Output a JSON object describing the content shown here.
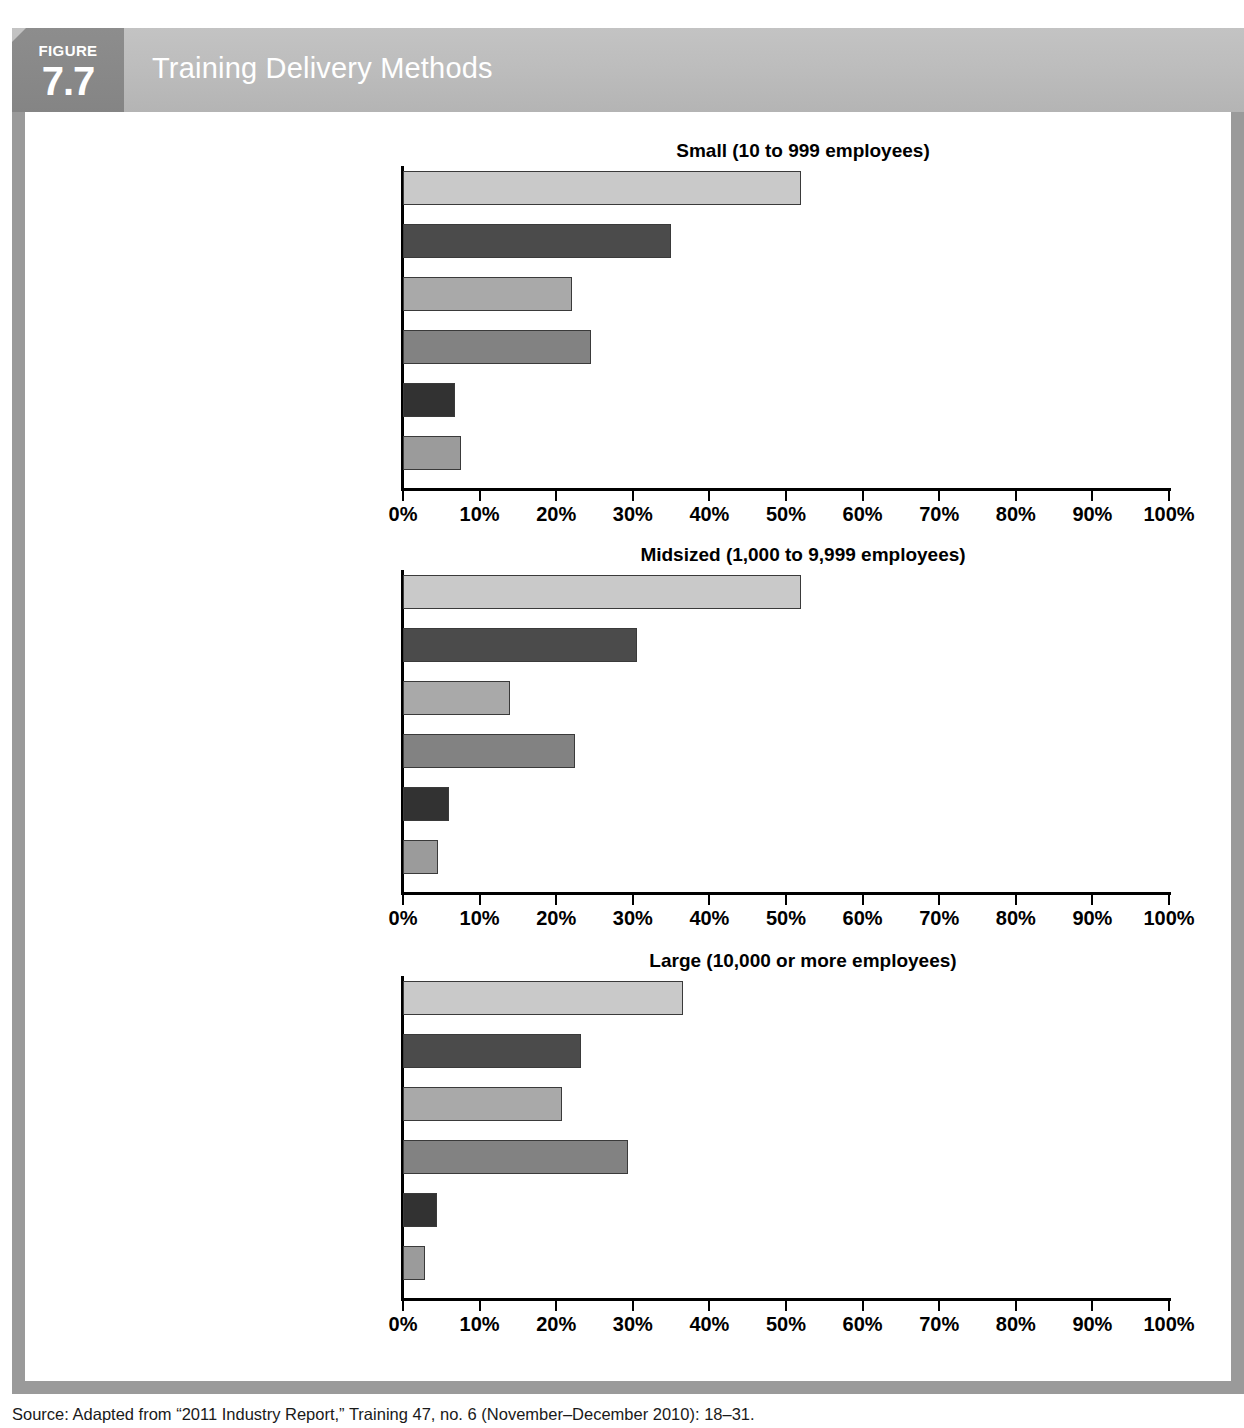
{
  "figure": {
    "badge_word": "FIGURE",
    "badge_number": "7.7",
    "title": "Training Delivery Methods"
  },
  "source_note": "Source: Adapted from “2011 Industry Report,” Training 47, no. 6 (November–December 2010): 18–31.",
  "axis": {
    "tick_labels": [
      "0%",
      "10%",
      "20%",
      "30%",
      "40%",
      "50%",
      "60%",
      "70%",
      "80%",
      "90%",
      "100%"
    ],
    "min": 0,
    "max": 100
  },
  "categories": [
    "Instructor-Led\nClassroom Only",
    "Blended Learning (a combination\nof methods listed below)",
    "Virtual Classroom/Webcast Only\n(instructor from remote location)",
    "Online or Computer-Based\nMethods Only (no instructor)",
    "Social Networking Only (wikis,\nblogs, communities of practice)",
    "Moblie Only (cell phones,\niPods, PDAs)"
  ],
  "bar_colors": [
    "#c9c9c9",
    "#4b4b4b",
    "#a9a9a9",
    "#828282",
    "#323232",
    "#9b9b9b"
  ],
  "chart_data": [
    {
      "type": "bar",
      "orientation": "horizontal",
      "title": "Small (10 to 999 employees)",
      "xlabel": "",
      "ylabel": "",
      "xlim": [
        0,
        100
      ],
      "grid": false,
      "legend": "none",
      "categories": [
        "Instructor-Led Classroom Only",
        "Blended Learning (a combination of methods listed below)",
        "Virtual Classroom/Webcast Only (instructor from remote location)",
        "Online or Computer-Based Methods Only (no instructor)",
        "Social Networking Only (wikis, blogs, communities of practice)",
        "Moblie Only (cell phones, iPods, PDAs)"
      ],
      "values": [
        52,
        35,
        22,
        24.5,
        6.8,
        7.6
      ],
      "tick_labels": [
        "0%",
        "10%",
        "20%",
        "30%",
        "40%",
        "50%",
        "60%",
        "70%",
        "80%",
        "90%",
        "100%"
      ]
    },
    {
      "type": "bar",
      "orientation": "horizontal",
      "title": "Midsized (1,000 to 9,999 employees)",
      "xlabel": "",
      "ylabel": "",
      "xlim": [
        0,
        100
      ],
      "grid": false,
      "legend": "none",
      "categories": [
        "Instructor-Led Classroom Only",
        "Blended Learning (a combination of methods listed below)",
        "Virtual Classroom/Webcast Only (instructor from remote location)",
        "Online or Computer-Based Methods Only (no instructor)",
        "Social Networking Only (wikis, blogs, communities of practice)",
        "Moblie Only (cell phones, iPods, PDAs)"
      ],
      "values": [
        52,
        30.5,
        14,
        22.5,
        6,
        4.6
      ],
      "tick_labels": [
        "0%",
        "10%",
        "20%",
        "30%",
        "40%",
        "50%",
        "60%",
        "70%",
        "80%",
        "90%",
        "100%"
      ]
    },
    {
      "type": "bar",
      "orientation": "horizontal",
      "title": "Large (10,000 or more employees)",
      "xlabel": "",
      "ylabel": "",
      "xlim": [
        0,
        100
      ],
      "grid": false,
      "legend": "none",
      "categories": [
        "Instructor-Led Classroom Only",
        "Blended Learning (a combination of methods listed below)",
        "Virtual Classroom/Webcast Only (instructor from remote location)",
        "Online or Computer-Based Methods Only (no instructor)",
        "Social Networking Only (wikis, blogs, communities of practice)",
        "Moblie Only (cell phones, iPods, PDAs)"
      ],
      "values": [
        36.6,
        23.2,
        20.7,
        29.4,
        4.4,
        2.9
      ],
      "tick_labels": [
        "0%",
        "10%",
        "20%",
        "30%",
        "40%",
        "50%",
        "60%",
        "70%",
        "80%",
        "90%",
        "100%"
      ]
    }
  ]
}
